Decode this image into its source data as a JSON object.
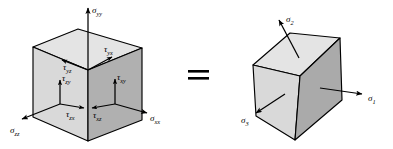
{
  "figure": {
    "relation_symbol": "=",
    "colors": {
      "top_face": "#e4e4e4",
      "left_face": "#d9d9d9",
      "right_face": "#b0b0b0",
      "outline": "#000000",
      "background": "#ffffff",
      "label": "#000000"
    }
  },
  "left_cube": {
    "name": "general-stress-cube",
    "description": "Cube showing general stress components on three visible faces",
    "labels": {
      "sigma_yy": {
        "base": "σ",
        "sub": "yy",
        "direction": "up"
      },
      "sigma_xx": {
        "base": "σ",
        "sub": "xx",
        "direction": "right"
      },
      "sigma_zz": {
        "base": "σ",
        "sub": "zz",
        "direction": "down-left"
      },
      "tau_yx": {
        "base": "τ",
        "sub": "yx",
        "direction": "right"
      },
      "tau_yz": {
        "base": "τ",
        "sub": "yz",
        "direction": "left"
      },
      "tau_zy": {
        "base": "τ",
        "sub": "zy",
        "direction": "up"
      },
      "tau_xy": {
        "base": "τ",
        "sub": "xy",
        "direction": "up"
      },
      "tau_zx": {
        "base": "τ",
        "sub": "zx",
        "direction": "right"
      },
      "tau_xz": {
        "base": "τ",
        "sub": "xz",
        "direction": "left"
      }
    }
  },
  "right_cube": {
    "name": "principal-stress-cube",
    "description": "Rotated cube showing the three principal stresses",
    "labels": {
      "sigma_1": {
        "base": "σ",
        "sub": "1",
        "direction": "right"
      },
      "sigma_2": {
        "base": "σ",
        "sub": "2",
        "direction": "up-left"
      },
      "sigma_3": {
        "base": "σ",
        "sub": "3",
        "direction": "down-left"
      }
    }
  }
}
